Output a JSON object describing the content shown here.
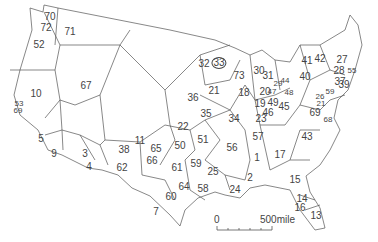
{
  "map": {
    "title": "",
    "line_color": "#555555",
    "label_color": "#444444",
    "regions": [
      {
        "id": "70",
        "x": 50,
        "y": 17
      },
      {
        "id": "72",
        "x": 46,
        "y": 28
      },
      {
        "id": "71",
        "x": 70,
        "y": 32
      },
      {
        "id": "52",
        "x": 39,
        "y": 45
      },
      {
        "id": "10",
        "x": 36,
        "y": 94
      },
      {
        "id": "53",
        "x": 19,
        "y": 104,
        "small": true
      },
      {
        "id": "69",
        "x": 18,
        "y": 111,
        "small": true
      },
      {
        "id": "67",
        "x": 86,
        "y": 86
      },
      {
        "id": "5",
        "x": 41,
        "y": 139
      },
      {
        "id": "9",
        "x": 54,
        "y": 154
      },
      {
        "id": "3",
        "x": 85,
        "y": 154
      },
      {
        "id": "4",
        "x": 89,
        "y": 167
      },
      {
        "id": "38",
        "x": 124,
        "y": 150
      },
      {
        "id": "62",
        "x": 122,
        "y": 168
      },
      {
        "id": "11",
        "x": 140,
        "y": 141
      },
      {
        "id": "32",
        "x": 204,
        "y": 64
      },
      {
        "id": "33",
        "x": 219,
        "y": 63,
        "circled": true
      },
      {
        "id": "36",
        "x": 193,
        "y": 98
      },
      {
        "id": "21",
        "x": 214,
        "y": 91
      },
      {
        "id": "73",
        "x": 239,
        "y": 76
      },
      {
        "id": "18",
        "x": 244,
        "y": 93
      },
      {
        "id": "30",
        "x": 259,
        "y": 71
      },
      {
        "id": "31",
        "x": 268,
        "y": 76
      },
      {
        "id": "29",
        "x": 278,
        "y": 84,
        "small": true
      },
      {
        "id": "44",
        "x": 285,
        "y": 81,
        "small": true
      },
      {
        "id": "41",
        "x": 307,
        "y": 61
      },
      {
        "id": "42",
        "x": 320,
        "y": 59
      },
      {
        "id": "27",
        "x": 342,
        "y": 60
      },
      {
        "id": "28",
        "x": 339,
        "y": 71
      },
      {
        "id": "55",
        "x": 352,
        "y": 71,
        "small": true
      },
      {
        "id": "40",
        "x": 305,
        "y": 77
      },
      {
        "id": "37",
        "x": 340,
        "y": 82
      },
      {
        "id": "39",
        "x": 344,
        "y": 85
      },
      {
        "id": "20",
        "x": 265,
        "y": 92
      },
      {
        "id": "47",
        "x": 272,
        "y": 92,
        "small": true
      },
      {
        "id": "48",
        "x": 289,
        "y": 93,
        "small": true
      },
      {
        "id": "19",
        "x": 260,
        "y": 104
      },
      {
        "id": "49",
        "x": 273,
        "y": 103
      },
      {
        "id": "45",
        "x": 284,
        "y": 107
      },
      {
        "id": "46",
        "x": 268,
        "y": 113
      },
      {
        "id": "26",
        "x": 320,
        "y": 97,
        "small": true
      },
      {
        "id": "59b",
        "x": 330,
        "y": 92,
        "label": "59",
        "small": true
      },
      {
        "id": "21b",
        "x": 321,
        "y": 104,
        "label": "21",
        "small": true
      },
      {
        "id": "69b",
        "x": 315,
        "y": 113,
        "label": "69"
      },
      {
        "id": "68",
        "x": 328,
        "y": 120,
        "small": true
      },
      {
        "id": "22",
        "x": 183,
        "y": 127
      },
      {
        "id": "35",
        "x": 206,
        "y": 114
      },
      {
        "id": "34",
        "x": 234,
        "y": 119
      },
      {
        "id": "23",
        "x": 261,
        "y": 119
      },
      {
        "id": "57",
        "x": 258,
        "y": 137
      },
      {
        "id": "43",
        "x": 307,
        "y": 137
      },
      {
        "id": "65",
        "x": 156,
        "y": 149
      },
      {
        "id": "50",
        "x": 180,
        "y": 146
      },
      {
        "id": "51",
        "x": 203,
        "y": 140
      },
      {
        "id": "56",
        "x": 232,
        "y": 148
      },
      {
        "id": "1",
        "x": 257,
        "y": 158
      },
      {
        "id": "17",
        "x": 280,
        "y": 155
      },
      {
        "id": "66",
        "x": 152,
        "y": 161
      },
      {
        "id": "61",
        "x": 177,
        "y": 168
      },
      {
        "id": "59",
        "x": 196,
        "y": 164
      },
      {
        "id": "25",
        "x": 213,
        "y": 172
      },
      {
        "id": "2",
        "x": 250,
        "y": 178
      },
      {
        "id": "15",
        "x": 295,
        "y": 180
      },
      {
        "id": "64",
        "x": 184,
        "y": 187
      },
      {
        "id": "58",
        "x": 203,
        "y": 189
      },
      {
        "id": "60",
        "x": 171,
        "y": 197
      },
      {
        "id": "24",
        "x": 235,
        "y": 190
      },
      {
        "id": "7",
        "x": 156,
        "y": 212
      },
      {
        "id": "14",
        "x": 302,
        "y": 199
      },
      {
        "id": "16",
        "x": 300,
        "y": 208
      },
      {
        "id": "13",
        "x": 316,
        "y": 216
      }
    ]
  },
  "scale_bar": {
    "start_label": "0",
    "end_label": "500mile"
  }
}
